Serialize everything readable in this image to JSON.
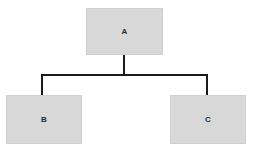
{
  "diagram": {
    "type": "tree",
    "background_color": "#ffffff",
    "node_fill_color": "#d8d8d8",
    "node_border_color": "#cfcfcf",
    "connector_color": "#1a1a1a",
    "connector_width": 2,
    "nodes": [
      {
        "id": "a",
        "label": "A",
        "role": "root",
        "x": 86,
        "y": 8,
        "width": 77,
        "height": 47
      },
      {
        "id": "b",
        "label": "B",
        "role": "child",
        "x": 6,
        "y": 95,
        "width": 76,
        "height": 49
      },
      {
        "id": "c",
        "label": "C",
        "role": "child",
        "x": 170,
        "y": 95,
        "width": 76,
        "height": 49
      }
    ],
    "edges": [
      {
        "from": "a",
        "to": "b"
      },
      {
        "from": "a",
        "to": "c"
      }
    ],
    "connector_geometry": {
      "trunk_x": 124,
      "trunk_top_y": 55,
      "bus_y": 75,
      "bus_left_x": 41,
      "bus_right_x": 208,
      "branch_bottom_y": 95
    }
  }
}
